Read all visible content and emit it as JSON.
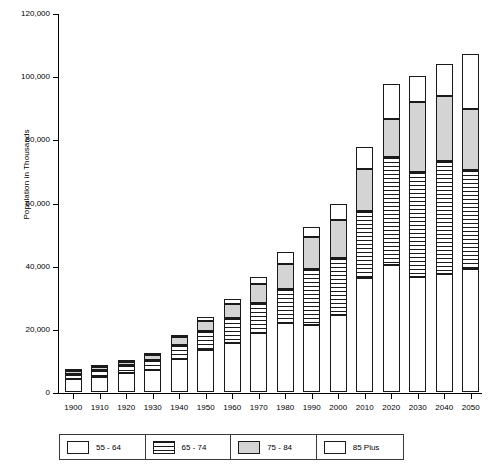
{
  "chart_data": {
    "type": "bar",
    "stacked": true,
    "title": "",
    "xlabel": "",
    "ylabel": "Population in Thousands",
    "ylim": [
      0,
      120000
    ],
    "ytick_values": [
      0,
      20000,
      40000,
      60000,
      80000,
      100000,
      120000
    ],
    "ytick_labels": [
      "0",
      "20,000",
      "40,000",
      "60,000",
      "80,000",
      "100,000",
      "120,000"
    ],
    "grid": false,
    "legend_position": "bottom",
    "categories": [
      "1900",
      "1910",
      "1920",
      "1930",
      "1940",
      "1950",
      "1960",
      "1970",
      "1980",
      "1990",
      "2000",
      "2010",
      "2020",
      "2030",
      "2040",
      "2050"
    ],
    "series": [
      {
        "name": "55 - 64",
        "fill": "white",
        "color": "#ffffff",
        "values": [
          4000,
          4900,
          5900,
          7100,
          10500,
          13300,
          15600,
          18600,
          21700,
          21100,
          24300,
          36100,
          40200,
          36400,
          37400,
          38900
        ]
      },
      {
        "name": "65 - 74",
        "fill": "horizontal-stripes",
        "color": "#ffffff",
        "values": [
          1700,
          2100,
          2500,
          3000,
          4400,
          6000,
          7800,
          9600,
          11000,
          18000,
          18000,
          21300,
          34300,
          33300,
          35600,
          31500
        ]
      },
      {
        "name": "75 - 84",
        "fill": "gray",
        "color": "#d4d4d4",
        "values": [
          800,
          1000,
          1200,
          1500,
          2400,
          3300,
          4600,
          6100,
          7700,
          10100,
          12300,
          13100,
          12100,
          22200,
          20600,
          19100
        ]
      },
      {
        "name": "85 Plus",
        "fill": "white",
        "color": "#ffffff",
        "values": [
          200,
          300,
          400,
          500,
          700,
          1000,
          1500,
          2200,
          4000,
          3200,
          4900,
          7100,
          10800,
          8300,
          10400,
          17500
        ]
      }
    ],
    "totals": [
      6700,
      8300,
      10000,
      12100,
      18000,
      23600,
      29500,
      36500,
      44400,
      52400,
      59500,
      77600,
      97400,
      100200,
      104000,
      107000
    ]
  },
  "legend": {
    "items": [
      {
        "label": "55 - 64",
        "swatch": "white-swatch"
      },
      {
        "label": "65 - 74",
        "swatch": "striped-swatch"
      },
      {
        "label": "75 - 84",
        "swatch": "gray-swatch"
      },
      {
        "label": "85 Plus",
        "swatch": "white-swatch"
      }
    ]
  }
}
